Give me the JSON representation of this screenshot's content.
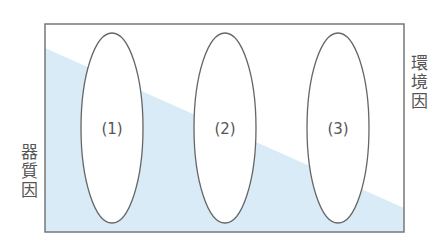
{
  "diagram": {
    "left_label": [
      "器",
      "質",
      "因"
    ],
    "right_label": [
      "環",
      "境",
      "因"
    ],
    "ellipses": [
      {
        "label": "(1)",
        "cx": 112,
        "cy": 128,
        "rx": 31,
        "ry": 95
      },
      {
        "label": "(2)",
        "cx": 225,
        "cy": 128,
        "rx": 31,
        "ry": 95
      },
      {
        "label": "(3)",
        "cx": 338,
        "cy": 128,
        "rx": 31,
        "ry": 95
      }
    ],
    "colors": {
      "frame": "#777777",
      "fill": "#d8ebf6",
      "ellipse_stroke": "#666666",
      "text": "#555555"
    }
  }
}
